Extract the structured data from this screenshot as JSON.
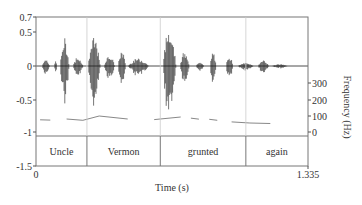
{
  "chart_data": {
    "type": "line",
    "title": "",
    "xlabel": "Time (s)",
    "ylabel_left": "",
    "ylabel_right": "Frequency (Hz)",
    "xlim": [
      0,
      1.335
    ],
    "ylim": [
      -1.5,
      0.7
    ],
    "x_ticks": [
      "0",
      "1.335"
    ],
    "y_ticks_left": [
      "0.7",
      "0.5",
      "0",
      "-0.5",
      "-1",
      "-1.5"
    ],
    "y_ticks_right": [
      "300",
      "200",
      "100",
      "0"
    ],
    "grid": false,
    "legend": null,
    "series": [
      {
        "name": "Waveform",
        "type": "waveform",
        "description": "speech audio amplitude"
      },
      {
        "name": "Pitch (F0)",
        "type": "line",
        "unit": "Hz",
        "points": [
          {
            "t": 0.02,
            "hz": 75
          },
          {
            "t": 0.07,
            "hz": 73
          },
          {
            "t": 0.15,
            "hz": 80
          },
          {
            "t": 0.23,
            "hz": 72
          },
          {
            "t": 0.31,
            "hz": 98
          },
          {
            "t": 0.45,
            "hz": 80
          },
          {
            "t": 0.58,
            "hz": 76
          },
          {
            "t": 0.71,
            "hz": 92
          },
          {
            "t": 0.78,
            "hz": 85
          },
          {
            "t": 0.87,
            "hz": 78
          },
          {
            "t": 0.96,
            "hz": 62
          },
          {
            "t": 1.05,
            "hz": 55
          },
          {
            "t": 1.15,
            "hz": 52
          }
        ]
      }
    ],
    "word_tier": [
      {
        "label": "Uncle",
        "start": 0.0,
        "end": 0.25
      },
      {
        "label": "Vermon",
        "start": 0.25,
        "end": 0.61
      },
      {
        "label": "grunted",
        "start": 0.61,
        "end": 1.03
      },
      {
        "label": "again",
        "start": 1.03,
        "end": 1.335
      }
    ]
  }
}
